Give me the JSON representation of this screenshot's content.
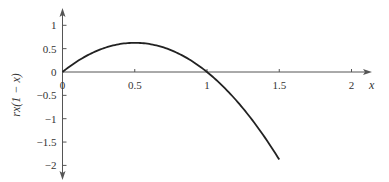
{
  "chart_data": {
    "type": "line",
    "title": "",
    "xlabel": "x",
    "ylabel": "rx(1 − x)",
    "function": "r*x*(1-x)",
    "r": 2.5,
    "xlim": [
      0,
      2
    ],
    "ylim": [
      -2,
      1
    ],
    "x_domain": [
      0,
      1.5
    ],
    "x_ticks": [
      0,
      0.5,
      1,
      1.5,
      2
    ],
    "x_tick_labels": [
      "0",
      "0.5",
      "1",
      "1.5",
      "2"
    ],
    "y_ticks": [
      1,
      0.5,
      0,
      -0.5,
      -1,
      -1.5,
      -2
    ],
    "y_tick_labels": [
      "1",
      "0.5",
      "0",
      "−0.5",
      "−1",
      "−1.5",
      "−2"
    ],
    "grid": false,
    "series": [
      {
        "name": "rx(1 − x)",
        "x": [
          0,
          0.25,
          0.5,
          0.75,
          1.0,
          1.25,
          1.5
        ],
        "y": [
          0,
          0.469,
          0.625,
          0.469,
          0,
          -0.781,
          -1.875
        ]
      }
    ],
    "colors": {
      "curve": "#222222",
      "axis": "#555555",
      "text": "#333333"
    }
  }
}
